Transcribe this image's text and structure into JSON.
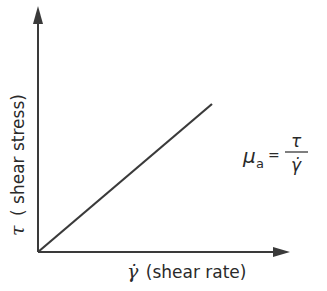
{
  "diagram": {
    "type": "line",
    "y_axis_label": {
      "symbol": "τ",
      "text": "( shear stress)"
    },
    "x_axis_label": {
      "symbol": "γ̇",
      "text": "(shear rate)"
    },
    "equation": {
      "lhs_symbol": "μ",
      "lhs_subscript": "a",
      "equals": "=",
      "numerator": "τ",
      "denominator": "γ̇"
    },
    "colors": {
      "ink": "#2a2a2a",
      "background": "#ffffff"
    }
  }
}
